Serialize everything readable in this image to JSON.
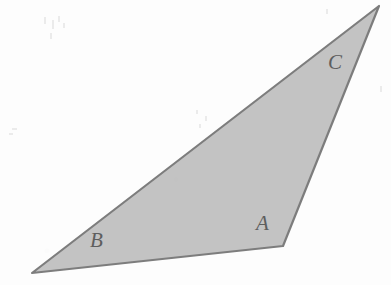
{
  "figure": {
    "kind": "geometry-diagram",
    "shape": "triangle",
    "caption_text": "",
    "background_color": "#fdfdfd",
    "fill_color": "#c3c3c3",
    "stroke_color": "#7d7d7d",
    "stroke_width": 2.2,
    "label_color": "#5e5e5e",
    "vertices": [
      {
        "id": "A",
        "label": "A",
        "x": 283,
        "y": 246
      },
      {
        "id": "B",
        "label": "B",
        "x": 32,
        "y": 273
      },
      {
        "id": "C",
        "label": "C",
        "x": 379,
        "y": 6
      }
    ],
    "polygon_points": "379,6 283,246 32,273",
    "labels": [
      {
        "name": "A",
        "text": "A",
        "x": 256,
        "y": 211
      },
      {
        "name": "B",
        "text": "B",
        "x": 90,
        "y": 228
      },
      {
        "name": "C",
        "text": "C",
        "x": 328,
        "y": 50
      }
    ],
    "edges": [
      {
        "name": "side-BC",
        "from": "B",
        "to": "C"
      },
      {
        "name": "side-CA",
        "from": "C",
        "to": "A"
      },
      {
        "name": "side-AB",
        "from": "A",
        "to": "B"
      }
    ],
    "scan_artifacts": [
      {
        "x": 44,
        "y": 17,
        "w": 2,
        "h": 7,
        "type": "streak"
      },
      {
        "x": 52,
        "y": 20,
        "w": 2,
        "h": 9,
        "type": "streak"
      },
      {
        "x": 58,
        "y": 16,
        "w": 2,
        "h": 6,
        "type": "streak"
      },
      {
        "x": 50,
        "y": 33,
        "w": 2,
        "h": 6,
        "type": "streak"
      },
      {
        "x": 63,
        "y": 23,
        "w": 2,
        "h": 5,
        "type": "streak"
      },
      {
        "x": 12,
        "y": 128,
        "w": 5,
        "h": 2,
        "type": "streak"
      },
      {
        "x": 9,
        "y": 133,
        "w": 4,
        "h": 2,
        "type": "streak"
      },
      {
        "x": 196,
        "y": 110,
        "w": 2,
        "h": 4,
        "type": "streak"
      },
      {
        "x": 205,
        "y": 116,
        "w": 2,
        "h": 5,
        "type": "streak"
      },
      {
        "x": 199,
        "y": 124,
        "w": 2,
        "h": 4,
        "type": "streak"
      },
      {
        "x": 380,
        "y": 86,
        "w": 2,
        "h": 6,
        "type": "streak"
      },
      {
        "x": 326,
        "y": 9,
        "w": 2,
        "h": 5,
        "type": "streak"
      }
    ]
  }
}
